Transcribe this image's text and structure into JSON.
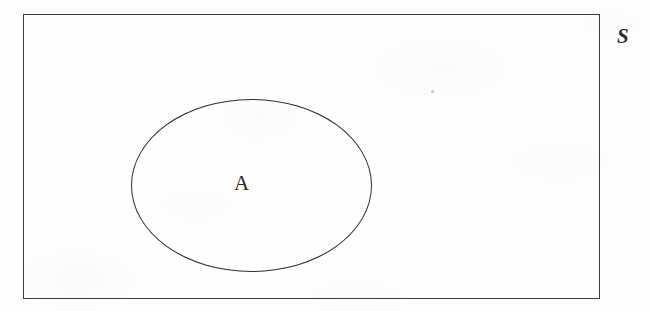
{
  "diagram": {
    "type": "venn",
    "background_color": "#fefefe",
    "stroke_color": "#2f2f2f",
    "universe": {
      "shape": "rectangle",
      "label": "S",
      "label_position": "outside-top-right",
      "bounds": {
        "x": 23,
        "y": 14,
        "width": 577,
        "height": 285
      }
    },
    "sets": [
      {
        "name": "set-a",
        "shape": "ellipse",
        "label": "A",
        "label_position": "inside-center",
        "bounds": {
          "x": 131,
          "y": 99,
          "width": 241,
          "height": 173
        },
        "center": {
          "x": 252,
          "y": 185
        },
        "radius_x": 120,
        "radius_y": 86
      }
    ],
    "artifacts": [
      {
        "name": "scan-speck",
        "x": 431,
        "y": 90
      }
    ]
  }
}
